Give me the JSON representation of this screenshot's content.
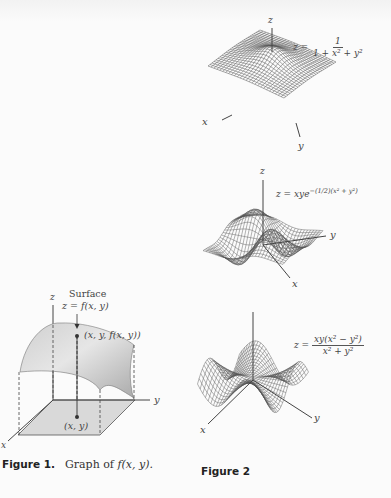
{
  "figure1": {
    "caption_label": "Figure 1.",
    "caption_text_prefix": "Graph of ",
    "caption_text_func": "f(x, y).",
    "surface_label": "Surface",
    "surface_eq": "z = f(x, y)",
    "point_label": "(x, y, f(x, y))",
    "base_point_label": "(x, y)",
    "axes": {
      "x": "x",
      "y": "y",
      "z": "z"
    }
  },
  "figure2": {
    "caption_label": "Figure 2",
    "plots": [
      {
        "equation_lhs": "z =",
        "equation_num": "1",
        "equation_den": "1 + x² + y²",
        "axes": {
          "x": "x",
          "y": "y",
          "z": "z"
        }
      },
      {
        "equation": "z = xye",
        "equation_exp": "−(1/2)(x² + y²)",
        "axes": {
          "x": "x",
          "y": "y",
          "z": "z"
        }
      },
      {
        "equation_lhs": "z =",
        "equation_num": "xy(x² − y²)",
        "equation_den": "x² + y²",
        "axes": {
          "x": "x",
          "y": "y",
          "z": "z"
        }
      }
    ]
  },
  "colors": {
    "page": "#fbfbfb",
    "ink": "#333333",
    "surface_fill": "#bdbdbd",
    "plane_fill": "#d9d9d9",
    "mesh": "#555555"
  }
}
